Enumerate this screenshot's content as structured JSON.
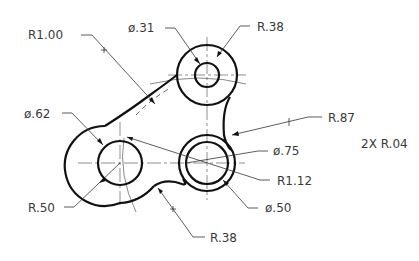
{
  "drawing": {
    "type": "mechanical-part-dimensioned",
    "colors": {
      "object_line": "#111111",
      "text": "#3a3a3a",
      "background": "#ffffff"
    },
    "dimensions": {
      "r100": {
        "label": "R1.00",
        "x": 28,
        "y": 54
      },
      "d031": {
        "label": "ø.31",
        "x": 130,
        "y": 30
      },
      "r038_top": {
        "label": "R.38",
        "x": 257,
        "y": 31
      },
      "d062": {
        "label": "ø.62",
        "x": 26,
        "y": 118
      },
      "r087": {
        "label": "R.87",
        "x": 328,
        "y": 122
      },
      "r004": {
        "label": "2X  R.04",
        "x": 361,
        "y": 148
      },
      "d075": {
        "label": "ø.75",
        "x": 273,
        "y": 155
      },
      "r112": {
        "label": "R1.12",
        "x": 277,
        "y": 183
      },
      "r050": {
        "label": "R.50",
        "x": 28,
        "y": 211
      },
      "d050": {
        "label": "ø.50",
        "x": 265,
        "y": 212
      },
      "r038_bottom": {
        "label": "R.38",
        "x": 210,
        "y": 240
      }
    }
  }
}
